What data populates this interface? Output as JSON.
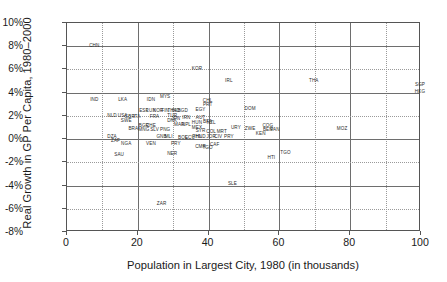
{
  "chart_data": {
    "type": "scatter",
    "title": "",
    "xlabel": "Population in Largest City, 1980 (in thousands)",
    "ylabel": "Real Growth in GP Per Capita, 1980–2000",
    "xlim": [
      0,
      100
    ],
    "ylim": [
      -8,
      10
    ],
    "xticks": [
      "0",
      "20",
      "40",
      "60",
      "80",
      "100"
    ],
    "xtick_values": [
      0,
      20,
      40,
      60,
      80,
      100
    ],
    "yticks": [
      "10%",
      "8%",
      "6%",
      "4%",
      "2%",
      "0%",
      "-2%",
      "-4%",
      "-6%",
      "-8%"
    ],
    "ytick_values": [
      10,
      8,
      6,
      4,
      2,
      0,
      -2,
      -4,
      -6,
      -8
    ],
    "grid": "both",
    "minor_grid_x": [
      10,
      30,
      50,
      70,
      90
    ],
    "legend": "none",
    "point_style": "text-labels-only",
    "points": [
      {
        "label": "CHN",
        "x": 8,
        "y": 8.0
      },
      {
        "label": "KOR",
        "x": 37,
        "y": 6.0
      },
      {
        "label": "IRL",
        "x": 46,
        "y": 5.0
      },
      {
        "label": "THA",
        "x": 70,
        "y": 5.0
      },
      {
        "label": "SGP",
        "x": 100,
        "y": 4.7
      },
      {
        "label": "HKG",
        "x": 100,
        "y": 4.1
      },
      {
        "label": "IND",
        "x": 8,
        "y": 3.4
      },
      {
        "label": "LKA",
        "x": 16,
        "y": 3.4
      },
      {
        "label": "IDN",
        "x": 24,
        "y": 3.4
      },
      {
        "label": "MYS",
        "x": 28,
        "y": 3.6
      },
      {
        "label": "CHL",
        "x": 40,
        "y": 3.3
      },
      {
        "label": "PRT",
        "x": 40,
        "y": 2.9
      },
      {
        "label": "DOM",
        "x": 52,
        "y": 2.6
      },
      {
        "label": "EGY",
        "x": 38,
        "y": 2.5
      },
      {
        "label": "ESP",
        "x": 22,
        "y": 2.4
      },
      {
        "label": "NOR",
        "x": 26,
        "y": 2.4
      },
      {
        "label": "FIN",
        "x": 28,
        "y": 2.4
      },
      {
        "label": "LUX",
        "x": 24,
        "y": 2.4
      },
      {
        "label": "THA2",
        "x": 30,
        "y": 2.4
      },
      {
        "label": "IND2",
        "x": 31,
        "y": 2.4
      },
      {
        "label": "BGD",
        "x": 33,
        "y": 2.4
      },
      {
        "label": "NLD",
        "x": 13,
        "y": 2.0
      },
      {
        "label": "USA",
        "x": 16,
        "y": 2.0
      },
      {
        "label": "GBR",
        "x": 18,
        "y": 1.9
      },
      {
        "label": "ITA",
        "x": 20,
        "y": 1.9
      },
      {
        "label": "FRA",
        "x": 25,
        "y": 1.9
      },
      {
        "label": "TUR",
        "x": 30,
        "y": 2.0
      },
      {
        "label": "JPN",
        "x": 31,
        "y": 1.7
      },
      {
        "label": "SWE",
        "x": 17,
        "y": 1.6
      },
      {
        "label": "DNK",
        "x": 30,
        "y": 1.6
      },
      {
        "label": "IRN",
        "x": 34,
        "y": 1.8
      },
      {
        "label": "AUT",
        "x": 38,
        "y": 1.8
      },
      {
        "label": "BFA",
        "x": 40,
        "y": 1.5
      },
      {
        "label": "HUN",
        "x": 37,
        "y": 1.4
      },
      {
        "label": "NZL",
        "x": 41,
        "y": 1.4
      },
      {
        "label": "BRA",
        "x": 19,
        "y": 0.9
      },
      {
        "label": "BGR",
        "x": 22,
        "y": 1.1
      },
      {
        "label": "CHE",
        "x": 24,
        "y": 1.1
      },
      {
        "label": "MNG",
        "x": 22,
        "y": 0.8
      },
      {
        "label": "SLV",
        "x": 25,
        "y": 0.8
      },
      {
        "label": "PNG",
        "x": 28,
        "y": 0.8
      },
      {
        "label": "MAR",
        "x": 32,
        "y": 1.2
      },
      {
        "label": "NPL",
        "x": 34,
        "y": 1.2
      },
      {
        "label": "MEX",
        "x": 37,
        "y": 1.0
      },
      {
        "label": "SYR",
        "x": 38,
        "y": 0.7
      },
      {
        "label": "COL",
        "x": 41,
        "y": 0.6
      },
      {
        "label": "MRT",
        "x": 44,
        "y": 0.6
      },
      {
        "label": "URY",
        "x": 48,
        "y": 1.0
      },
      {
        "label": "ZWE",
        "x": 52,
        "y": 0.9
      },
      {
        "label": "COG",
        "x": 57,
        "y": 1.1
      },
      {
        "label": "BEN",
        "x": 57,
        "y": 0.8
      },
      {
        "label": "PAN",
        "x": 59,
        "y": 0.8
      },
      {
        "label": "MOZ",
        "x": 78,
        "y": 0.9
      },
      {
        "label": "DZA",
        "x": 13,
        "y": 0.2
      },
      {
        "label": "ZAF",
        "x": 14,
        "y": -0.2
      },
      {
        "label": "NGA",
        "x": 17,
        "y": -0.4
      },
      {
        "label": "GNB",
        "x": 27,
        "y": 0.2
      },
      {
        "label": "MLI",
        "x": 29,
        "y": 0.2
      },
      {
        "label": "VEN",
        "x": 24,
        "y": -0.4
      },
      {
        "label": "PRY",
        "x": 31,
        "y": -0.4
      },
      {
        "label": "BOL",
        "x": 33,
        "y": 0.1
      },
      {
        "label": "ECU",
        "x": 35,
        "y": 0.1
      },
      {
        "label": "PHL",
        "x": 37,
        "y": 0.2
      },
      {
        "label": "HND",
        "x": 38,
        "y": 0.2
      },
      {
        "label": "JOR",
        "x": 41,
        "y": 0.2
      },
      {
        "label": "CIV",
        "x": 43,
        "y": 0.2
      },
      {
        "label": "PRY2",
        "x": 46,
        "y": 0.2
      },
      {
        "label": "CMR",
        "x": 38,
        "y": -0.7
      },
      {
        "label": "TGO",
        "x": 40,
        "y": -0.8
      },
      {
        "label": "CAF",
        "x": 42,
        "y": -0.5
      },
      {
        "label": "KEN",
        "x": 55,
        "y": 0.4
      },
      {
        "label": "SAU",
        "x": 15,
        "y": -1.4
      },
      {
        "label": "NER",
        "x": 30,
        "y": -1.3
      },
      {
        "label": "TGO2",
        "x": 62,
        "y": -1.2
      },
      {
        "label": "HTI",
        "x": 58,
        "y": -1.6
      },
      {
        "label": "SLE",
        "x": 47,
        "y": -3.9
      },
      {
        "label": "ZAR",
        "x": 27,
        "y": -5.6
      }
    ]
  }
}
